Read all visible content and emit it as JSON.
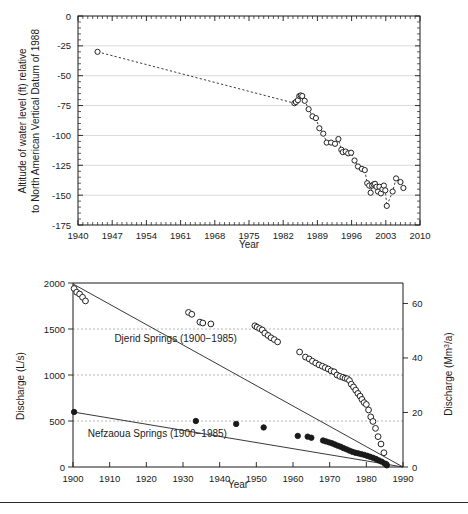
{
  "figure": {
    "background": "#ffffff",
    "rule_color": "#2b2b2b"
  },
  "chart_data": [
    {
      "id": "water-level-chart",
      "type": "scatter",
      "title": "",
      "xlabel": "Year",
      "ylabel": "Altitude of water level (ft) relative to North American Vertical Datum of 1988",
      "ylabel_line1": "Altitude of water level (ft) relative",
      "ylabel_line2": "to North American Vertical Datum of 1988",
      "xlim": [
        1940,
        2010
      ],
      "ylim": [
        -175,
        0
      ],
      "xticks": [
        1940,
        1947,
        1954,
        1961,
        1968,
        1975,
        1982,
        1989,
        1996,
        2003,
        2010
      ],
      "yticks": [
        0,
        -25,
        -50,
        -75,
        -100,
        -125,
        -150,
        -175
      ],
      "xticklabels": [
        "1940",
        "1947",
        "1954",
        "1961",
        "1968",
        "1975",
        "1982",
        "1989",
        "1996",
        "2003",
        "2010"
      ],
      "yticklabels": [
        "0",
        "-25",
        "-50",
        "-75",
        "-100",
        "-125",
        "-150",
        "-175"
      ],
      "grid": "horizontal",
      "legend": "none",
      "marker": "open-circle",
      "line_style": "dotted",
      "series": [
        {
          "name": "Water level",
          "x": [
            1944.0,
            1984.3,
            1984.6,
            1985.0,
            1985.3,
            1985.6,
            1985.9,
            1986.4,
            1987.2,
            1988.0,
            1988.7,
            1989.4,
            1990.2,
            1990.9,
            1991.8,
            1992.6,
            1993.3,
            1993.9,
            1994.2,
            1994.8,
            1995.3,
            1995.9,
            1996.6,
            1997.3,
            1998.1,
            1998.7,
            1999.2,
            1999.6,
            1999.9,
            2000.2,
            2000.5,
            2000.8,
            2001.1,
            2001.4,
            2001.7,
            2002.0,
            2002.3,
            2002.6,
            2002.9,
            2003.2,
            2004.4,
            2005.1,
            2006.0,
            2006.6
          ],
          "y": [
            -30.0,
            -73.0,
            -72.0,
            -70.5,
            -67.0,
            -66.5,
            -67.0,
            -71.0,
            -78.0,
            -84.0,
            -85.5,
            -94.0,
            -98.5,
            -106.0,
            -106.0,
            -107.0,
            -103.0,
            -112.0,
            -114.0,
            -113.5,
            -115.0,
            -114.5,
            -121.0,
            -126.0,
            -128.0,
            -129.0,
            -140.0,
            -142.0,
            -148.0,
            -142.0,
            -141.0,
            -140.5,
            -143.0,
            -147.0,
            -143.0,
            -148.5,
            -145.0,
            -142.0,
            -146.0,
            -159.0,
            -147.0,
            -136.0,
            -139.0,
            -144.0
          ]
        }
      ]
    },
    {
      "id": "spring-discharge-chart",
      "type": "scatter",
      "title": "",
      "xlabel": "Year",
      "ylabel_left": "Discharge (L/s)",
      "ylabel_right": "Discharge (Mm3/a)",
      "ylabel_right_base": "Discharge (Mm",
      "ylabel_right_sup": "3",
      "ylabel_right_tail": "/a)",
      "xlim": [
        1900,
        1990
      ],
      "ylim_left": [
        0,
        2000
      ],
      "ylim_right": [
        0,
        67.5
      ],
      "xticks": [
        1900,
        1910,
        1920,
        1930,
        1940,
        1950,
        1960,
        1970,
        1980,
        1990
      ],
      "xticklabels": [
        "1900",
        "1910",
        "1920",
        "1930",
        "1940",
        "1950",
        "1960",
        "1970",
        "1980",
        "1990"
      ],
      "yticks_left": [
        0,
        500,
        1000,
        1500,
        2000
      ],
      "yticklabels_left": [
        "0",
        "500",
        "1000",
        "1500",
        "2000"
      ],
      "yticks_right": [
        0,
        20,
        40,
        60
      ],
      "yticklabels_right": [
        "0",
        "20",
        "40",
        "60"
      ],
      "grid": "horizontal-dashed",
      "annotations": [
        {
          "text": "Djerid Springs (1900−1985)",
          "x": 1928,
          "y": 1355
        },
        {
          "text": "Nefzaoua Springs (1900−1985)",
          "x": 1923,
          "y": 330
        }
      ],
      "series": [
        {
          "name": "Djerid Springs (1900−1985)",
          "marker": "open-circle",
          "x": [
            1900.3,
            1901.0,
            1901.8,
            1902.6,
            1903.4,
            1931.5,
            1932.4,
            1934.6,
            1935.4,
            1937.6,
            1949.6,
            1950.2,
            1950.9,
            1951.6,
            1952.3,
            1953.2,
            1954.0,
            1954.9,
            1955.8,
            1961.8,
            1963.4,
            1964.4,
            1965.3,
            1966.2,
            1967.1,
            1968.0,
            1968.8,
            1969.6,
            1970.4,
            1971.2,
            1972.0,
            1972.8,
            1973.6,
            1974.2,
            1974.8,
            1975.4,
            1975.9,
            1976.5,
            1977.1,
            1977.7,
            1978.3,
            1978.8,
            1979.4,
            1980.0,
            1980.6,
            1981.2,
            1981.8,
            1982.5,
            1983.2,
            1984.0,
            1984.8,
            1985.4
          ],
          "y": [
            1940,
            1900,
            1880,
            1845,
            1805,
            1680,
            1660,
            1575,
            1565,
            1555,
            1535,
            1520,
            1505,
            1490,
            1455,
            1430,
            1405,
            1385,
            1360,
            1250,
            1195,
            1175,
            1150,
            1130,
            1110,
            1095,
            1080,
            1065,
            1045,
            1035,
            1000,
            985,
            975,
            965,
            960,
            940,
            900,
            870,
            835,
            800,
            770,
            735,
            700,
            680,
            620,
            545,
            495,
            420,
            330,
            250,
            155,
            30
          ]
        },
        {
          "name": "Nefzaoua Springs (1900−1985)",
          "marker": "filled-circle",
          "x": [
            1900.3,
            1933.5,
            1944.5,
            1952.0,
            1961.3,
            1964.0,
            1965.0,
            1968.2,
            1969.0,
            1969.8,
            1970.6,
            1971.4,
            1972.2,
            1973.0,
            1973.8,
            1974.6,
            1975.4,
            1976.2,
            1977.0,
            1977.8,
            1978.6,
            1979.4,
            1980.2,
            1981.0,
            1981.8,
            1982.6,
            1983.4,
            1984.2,
            1985.0,
            1985.6
          ],
          "y": [
            598,
            500,
            468,
            430,
            338,
            330,
            318,
            288,
            278,
            268,
            258,
            245,
            232,
            220,
            205,
            192,
            178,
            165,
            155,
            148,
            140,
            132,
            122,
            112,
            100,
            88,
            72,
            58,
            38,
            18
          ]
        }
      ],
      "trend_lines": [
        {
          "name": "Djerid trend",
          "x": [
            1900,
            1990
          ],
          "y": [
            1990,
            0
          ]
        },
        {
          "name": "Nefzaoua trend",
          "x": [
            1900,
            1990
          ],
          "y": [
            598,
            0
          ]
        }
      ]
    }
  ]
}
